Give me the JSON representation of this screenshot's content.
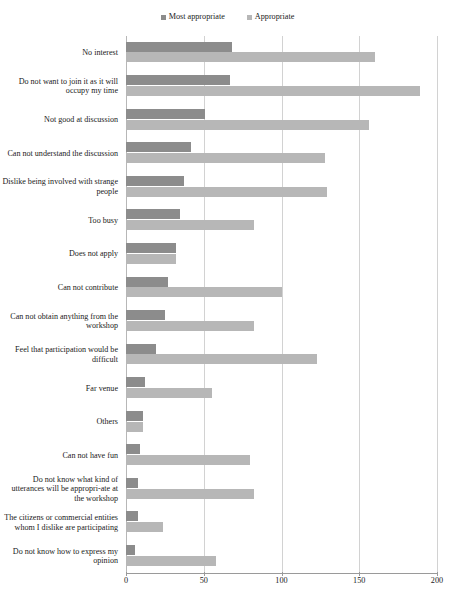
{
  "chart_data": {
    "type": "bar",
    "orientation": "horizontal",
    "title": "",
    "xlabel": "",
    "ylabel": "",
    "xlim": [
      0,
      200
    ],
    "xticks": [
      0,
      50,
      100,
      150,
      200
    ],
    "grid": "vertical",
    "legend_position": "top-center",
    "categories": [
      "No interest",
      "Do not want to join it as it will occupy my time",
      "Not good at discussion",
      "Can not understand the discussion",
      "Dislike being involved with strange people",
      "Too busy",
      "Does not apply",
      "Can not contribute",
      "Can not obtain anything from the workshop",
      "Feel that participation would be difficult",
      "Far venue",
      "Others",
      "Can not have fun",
      "Do not know what kind of utterances will be appropri-ate at the workshop",
      "The citizens or commercial entities whom I dislike are participating",
      "Do not know how to express my opinion"
    ],
    "series": [
      {
        "name": "Most appropriate",
        "color": "#8c8c8c",
        "values": [
          68,
          67,
          51,
          42,
          37,
          35,
          32,
          27,
          25,
          19,
          12,
          11,
          9,
          8,
          8,
          6
        ]
      },
      {
        "name": "Appropriate",
        "color": "#b7b7b7",
        "values": [
          160,
          189,
          156,
          128,
          129,
          82,
          32,
          100,
          82,
          123,
          55,
          11,
          80,
          82,
          24,
          58
        ]
      }
    ]
  },
  "legend": {
    "entries": [
      {
        "label": "Most appropriate",
        "color": "#8c8c8c"
      },
      {
        "label": "Appropriate",
        "color": "#b7b7b7"
      }
    ]
  },
  "axis": {
    "tick_labels": [
      "0",
      "50",
      "100",
      "150",
      "200"
    ]
  },
  "caption": ""
}
